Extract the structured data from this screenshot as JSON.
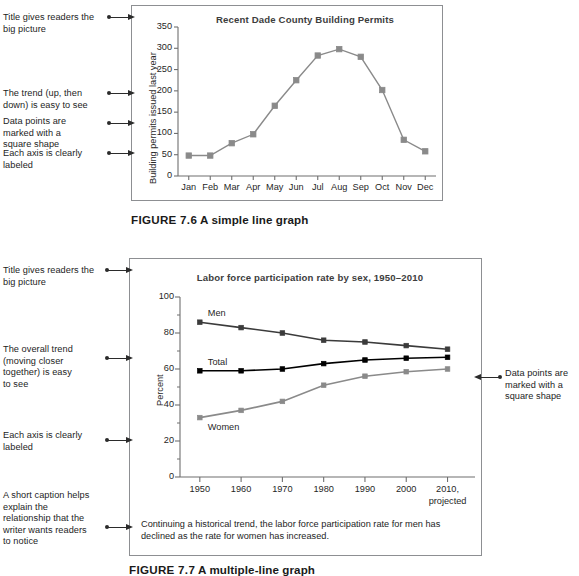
{
  "figure1": {
    "caption_number": "FIGURE 7.6",
    "caption_text": "A simple line graph",
    "annotations": [
      "Title gives readers the big picture",
      "The trend (up, then down) is easy to see",
      "Data points are marked with a square shape",
      "Each axis is clearly labeled"
    ]
  },
  "figure2": {
    "caption_number": "FIGURE 7.7",
    "caption_text": "A multiple-line graph",
    "annotations_left": [
      "Title gives readers the big picture",
      "The overall trend (moving closer together) is easy to see",
      "Each axis is clearly labeled",
      "A short caption helps explain the relationship that the writer wants readers to notice"
    ],
    "annotations_right": [
      "Data points are marked with a square shape"
    ],
    "inner_caption": "Continuing a historical trend, the labor force participation rate for men has declined as the rate for women has increased."
  },
  "chart_data": [
    {
      "type": "line",
      "title": "Recent Dade County Building Permits",
      "xlabel": "",
      "ylabel": "Building permits issued last year",
      "categories": [
        "Jan",
        "Feb",
        "Mar",
        "Apr",
        "May",
        "Jun",
        "Jul",
        "Aug",
        "Sep",
        "Oct",
        "Nov",
        "Dec"
      ],
      "values": [
        48,
        48,
        77,
        98,
        165,
        225,
        283,
        298,
        280,
        202,
        85,
        58
      ],
      "ylim": [
        0,
        350
      ],
      "yticks": [
        0,
        50,
        100,
        150,
        200,
        250,
        300,
        350
      ],
      "ytick_labels": [
        "0",
        "50",
        "100",
        "150",
        "200",
        "250",
        "300",
        "350"
      ],
      "grid": false,
      "marker": "square",
      "series_color": "#8a8a8a",
      "legend": "none"
    },
    {
      "type": "line",
      "title": "Labor force participation rate by sex, 1950–2010",
      "xlabel": "",
      "ylabel": "Percent",
      "categories": [
        "1950",
        "1960",
        "1970",
        "1980",
        "1990",
        "2000",
        "2010, projected"
      ],
      "x_tick_labels": [
        "1950",
        "1960",
        "1970",
        "1980",
        "1990",
        "2000",
        "2010,"
      ],
      "x_tick_sublabels": [
        "",
        "",
        "",
        "",
        "",
        "",
        "projected"
      ],
      "series": [
        {
          "name": "Men",
          "values": [
            86,
            83,
            80,
            76,
            75,
            73,
            71
          ],
          "color": "#3b3b3b"
        },
        {
          "name": "Total",
          "values": [
            59,
            59,
            60,
            63,
            65,
            66,
            66.5
          ],
          "color": "#000000"
        },
        {
          "name": "Women",
          "values": [
            33,
            37,
            42,
            51,
            56,
            58.5,
            60
          ],
          "color": "#8a8a8a"
        }
      ],
      "ylim": [
        0,
        100
      ],
      "yticks": [
        0,
        20,
        40,
        60,
        80,
        100
      ],
      "ytick_labels": [
        "0",
        "20",
        "40",
        "60",
        "80",
        "100"
      ],
      "yminor_step": 10,
      "grid": false,
      "marker": "square",
      "legend": "inline-labels"
    }
  ]
}
